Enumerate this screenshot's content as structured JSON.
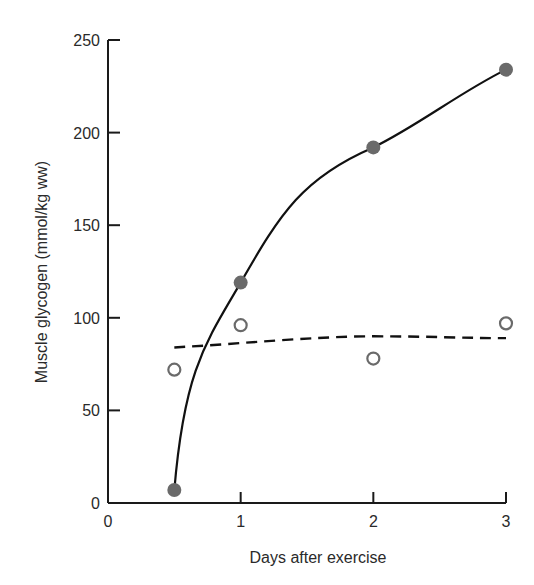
{
  "chart_data": {
    "type": "line",
    "title": "",
    "xlabel": "Days after exercise",
    "ylabel": "Muscle glycogen (mmol/kg ww)",
    "xlim": [
      0,
      3
    ],
    "ylim": [
      0,
      250
    ],
    "x_ticks": [
      0,
      1,
      2,
      3
    ],
    "x_tick_labels": [
      "0",
      "1",
      "2",
      "3"
    ],
    "y_ticks": [
      0,
      50,
      100,
      150,
      200,
      250
    ],
    "y_tick_labels": [
      "0",
      "50",
      "100",
      "150",
      "200",
      "250"
    ],
    "grid": false,
    "legend": null,
    "series": [
      {
        "name": "filled circles (solid fitted curve)",
        "marker": "filled-circle",
        "line": "solid",
        "x": [
          0.5,
          1,
          2,
          3
        ],
        "values": [
          7,
          119,
          192,
          234
        ]
      },
      {
        "name": "open circles (dashed fitted curve)",
        "marker": "open-circle",
        "line": "dashed",
        "x": [
          0.5,
          1,
          2,
          3
        ],
        "values": [
          72,
          96,
          78,
          97
        ],
        "fit_line": {
          "x": [
            0.5,
            1,
            2,
            3
          ],
          "values": [
            84,
            87,
            90,
            89
          ]
        }
      }
    ]
  },
  "colors": {
    "axis": "#1a1a1a",
    "curve": "#111111",
    "marker": "#6a6a6a",
    "text": "#2a2a2a"
  }
}
